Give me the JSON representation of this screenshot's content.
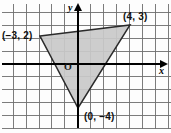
{
  "figure": {
    "name": "coordinate-plane-triangle",
    "width": 171,
    "height": 133,
    "background_color": "#fdfdfd"
  },
  "axes": {
    "x_label": "x",
    "y_label": "y",
    "origin_label": "O",
    "axis_color": "#000000",
    "grid_color": "#6e6e6e",
    "grid_spacing_px": 12.9,
    "origin_px": {
      "x": 78,
      "y": 64
    },
    "x_range": [
      -6,
      7
    ],
    "y_range": [
      -5,
      5
    ],
    "grid": true,
    "arrowheads": [
      "x-positive",
      "y-positive"
    ]
  },
  "shape": {
    "type": "triangle",
    "fill_color": "#c9c9c9",
    "stroke_color": "#2b2b2b",
    "vertices": [
      {
        "label": "(−3, 2)",
        "x": -3,
        "y": 2,
        "px": {
          "x": 40,
          "y": 36
        }
      },
      {
        "label": "(4, 3)",
        "x": 4,
        "y": 3,
        "px": {
          "x": 130,
          "y": 25
        }
      },
      {
        "label": "(0, −4)",
        "x": 0,
        "y": -4,
        "px": {
          "x": 78,
          "y": 108
        }
      }
    ]
  },
  "labels": {
    "vertex_1": "(−3, 2)",
    "vertex_2": "(4, 3)",
    "vertex_3": "(0, −4)",
    "origin": "O",
    "x_axis": "x",
    "y_axis": "y"
  }
}
